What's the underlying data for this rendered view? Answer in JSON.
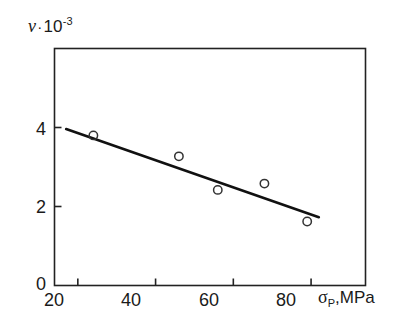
{
  "chart_data": {
    "type": "scatter",
    "title": "",
    "ylabel": "ν·10⁻³",
    "ylabel_symbol": "ν",
    "ylabel_dot": "·",
    "ylabel_mantissa": "10",
    "ylabel_exponent": "-3",
    "xlabel": "σₚ,MPa",
    "xlabel_symbol": "σ",
    "xlabel_subscript": "P",
    "xlabel_units": ",MPa",
    "xlim": [
      14,
      94
    ],
    "ylim": [
      0,
      6
    ],
    "xticks": [
      20,
      40,
      60,
      80
    ],
    "xtick_labels": [
      "20",
      "40",
      "60",
      "80"
    ],
    "yticks": [
      0,
      2,
      4
    ],
    "ytick_labels": [
      "0",
      "2",
      "4"
    ],
    "grid": false,
    "legend": "none",
    "series": [
      {
        "name": "measured",
        "marker": "open-circle",
        "x": [
          24,
          46,
          56,
          68,
          79
        ],
        "y": [
          3.8,
          3.27,
          2.42,
          2.58,
          1.62
        ]
      },
      {
        "name": "fit-line",
        "type": "line",
        "x": [
          17,
          82
        ],
        "y": [
          3.96,
          1.73
        ]
      }
    ],
    "colors": {
      "axis": "#222222",
      "line": "#111111",
      "marker": "#333333",
      "background": "#ffffff"
    }
  }
}
